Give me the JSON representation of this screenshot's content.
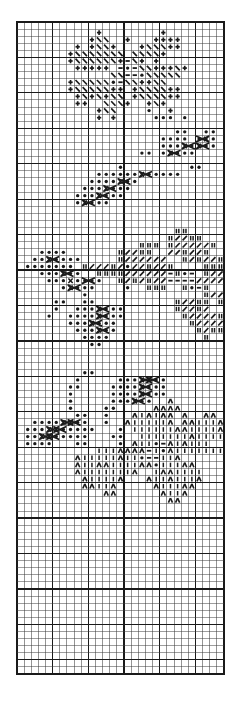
{
  "chart": {
    "title": "Knitting Stitch Chart",
    "type": "stitch-chart",
    "columns": 29,
    "rows": 92,
    "cell_width": 7.2,
    "cell_height": 7.1,
    "grid_color": "#1a1a1a",
    "thin_line_color": "#2a2a2a",
    "heavy_every": 5,
    "background": "#ffffff",
    "symbol_legend": {
      "+": "plus-stitch",
      "\\": "left-slant-decrease",
      "/": "right-slant-decrease",
      "*": "purl-dot",
      "-": "dash-stitch",
      "|": "single-bar-stitch",
      "H": "double-bar-stitch",
      "^": "caret-stitch",
      "X": "cable-cross"
    }
  },
  "chart_data": {
    "type": "heatmap",
    "title": "Knitting Stitch Chart",
    "xlabel": "",
    "ylabel": "",
    "columns": 29,
    "rows": 92,
    "legend": [
      {
        "symbol": "+",
        "name": "plus-stitch"
      },
      {
        "symbol": "\\",
        "name": "left-slant-decrease"
      },
      {
        "symbol": "/",
        "name": "right-slant-decrease"
      },
      {
        "symbol": "*",
        "name": "purl-dot"
      },
      {
        "symbol": "-",
        "name": "dash-stitch"
      },
      {
        "symbol": "|",
        "name": "single-bar-stitch"
      },
      {
        "symbol": "H",
        "name": "double-bar-stitch"
      },
      {
        "symbol": "^",
        "name": "caret-stitch"
      },
      {
        "symbol": "X",
        "name": "cable-cross"
      }
    ],
    "cells": [
      "                             ",
      "           +        +        ",
      "          +\\\\  +   ++++      ",
      "        + +\\\\+   +\\\\\\++     ",
      "       +\\\\\\\\\\\\\\ \\\\\\\\+    ",
      "       +\\\\\\\\\\\\+-\\+ +      ",
      "        +++++ -*-\\\\+++\\+     ",
      "             \\\\--*\\\\\\\\\\    ",
      "       +\\\\\\\\\\*-\\\\++\\\\    ",
      "       +\\\\\\\\\\++ +\\\\\\\\++   ",
      "        +\\+\\+\\\\ +\\\\\\\\++    ",
      "        ++  \\\\\\+  +\\+       ",
      "           +\\\\    *  +       ",
      "           + +     *** *      ",
      "                             ",
      "                      **  ** ",
      "                    **** *X* ",
      "                    ***X*X** ",
      "                 ** *X***    ",
      "                             ",
      "              *         **   ",
      "           ******X*****      ",
      "          ****X**            ",
      "         ***X***             ",
      "        ***X***              ",
      "        *X***                ",
      "                             ",
      "                             ",
      "                             ",
      "                      HH     ",
      "                     H//HH   ",
      "                 HHH H/////H ",
      "   ****       H//HH  //H//H  ",
      "  **X****     H//////  H/H//H",
      " ******* H///H/*//H//H    HHH",
      "   ***X**  HHHH//////-H*- H//",
      "    ***X****  H/H/H//----///// ",
      "      *X***    *  HHH  H*-H  *",
      "         *                H//H",
      "     **  **           H//HH H/",
      "     *  ***X***       H//H/   ",
      "    *  ****X***        H////H ",
      "       ***X***          H//// ",
      "        ***X**           H/HH ",
      "         ****             H   ",
      "          **                  ",
      "                             ",
      "                             ",
      "                             ",
      "         **                  ",
      "        *     ***XX**        ",
      "       **    ****X***        ",
      "       *     ****X***        ",
      "       *     ***X**  ^       ",
      "       *    **     ^^^^      ",
      "        **  *   ^|^|^^ ^  ^^ ",
      "  ****XX**  *  ^|||||^ ^^|||^",
      " ***XX*****   * ||||||^^||||^",
      " **XX*****   **  |||||||^|||| ",
      " ****   **    * ^||*-^|^|||  ^",
      "           |||^^^^-|*^||||||| ",
      "        ^|||||^||*--||^       ",
      "        ^||^^||||^^*|||^^     ",
      "        ^|||||||^  |^^||||    ",
      "         ^||||^   ^||^|||^    ",
      "         ^^||^     ^|||^^     ",
      "            ^^      ^||^      ",
      "                     ^^       ",
      "                             ",
      "                             ",
      "                             ",
      "                             ",
      "                             ",
      "                             ",
      "                             ",
      "                             ",
      "                             ",
      "                             ",
      "                             ",
      "                             ",
      "                             ",
      "                             ",
      "                             ",
      "                             ",
      "                             ",
      "                             ",
      "                             ",
      "                             ",
      "                             ",
      "                             ",
      "                             ",
      "                             ",
      "                             "
    ],
    "cable_crosses": [
      {
        "row": 16,
        "col": 25
      },
      {
        "row": 17,
        "col": 23
      },
      {
        "row": 17,
        "col": 25
      },
      {
        "row": 18,
        "col": 21
      },
      {
        "row": 21,
        "col": 17
      },
      {
        "row": 22,
        "col": 14
      },
      {
        "row": 23,
        "col": 12
      },
      {
        "row": 24,
        "col": 11
      },
      {
        "row": 25,
        "col": 9
      },
      {
        "row": 33,
        "col": 4
      },
      {
        "row": 35,
        "col": 6
      },
      {
        "row": 36,
        "col": 9
      },
      {
        "row": 37,
        "col": 7
      },
      {
        "row": 40,
        "col": 11
      },
      {
        "row": 41,
        "col": 11
      },
      {
        "row": 42,
        "col": 10
      },
      {
        "row": 43,
        "col": 11
      },
      {
        "row": 50,
        "col": 17
      },
      {
        "row": 50,
        "col": 18
      },
      {
        "row": 51,
        "col": 17
      },
      {
        "row": 52,
        "col": 17
      },
      {
        "row": 53,
        "col": 16
      },
      {
        "row": 56,
        "col": 6
      },
      {
        "row": 56,
        "col": 7
      },
      {
        "row": 57,
        "col": 4
      },
      {
        "row": 57,
        "col": 5
      },
      {
        "row": 58,
        "col": 3
      },
      {
        "row": 58,
        "col": 4
      }
    ]
  }
}
